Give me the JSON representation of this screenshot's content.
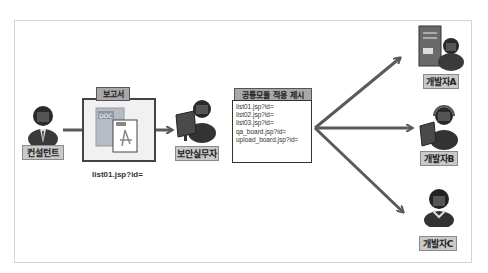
{
  "diagram": {
    "actors": {
      "consultant": {
        "label": "컨설턴트"
      },
      "security_officer": {
        "label": "보안실무자"
      },
      "developer_a": {
        "label": "개발자A"
      },
      "developer_b": {
        "label": "개발자B"
      },
      "developer_c": {
        "label": "개발자C"
      }
    },
    "report": {
      "title": "보고서",
      "caption": "list01.jsp?id=",
      "doc_badge": "DOC"
    },
    "proposal": {
      "title": "공통모듈 적용 제시",
      "items": [
        "list01.jsp?id=",
        "list02.jsp?id=",
        "list03.jsp?id=",
        "qa_board.jsp?id=",
        "upload_board.jsp?id="
      ]
    },
    "colors": {
      "arrow": "#5a5a5a",
      "label_bg": "#c9c9c9",
      "title_bg": "#a8a8a8",
      "frame": "#d4d4d4"
    }
  }
}
